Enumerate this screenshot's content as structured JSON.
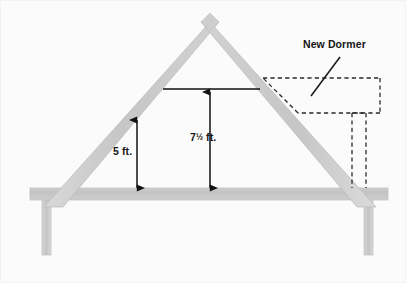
{
  "figure": {
    "width": 406,
    "height": 283,
    "background_color": "#fbfbfb",
    "frame_border_color": "#f2f2f2"
  },
  "labels": {
    "new_dormer": "New Dormer",
    "height_low": "5 ft.",
    "height_peak_whole": "7",
    "height_peak_fraction": "½",
    "height_peak_unit": " ft.",
    "height_peak_full": "7½ ft."
  },
  "colors": {
    "timber_fill": "#c9c9c9",
    "timber_fill_light": "#d6d6d6",
    "timber_stroke": "#b4b4b4",
    "joist_fill": "#c4c4c4",
    "dimension_line": "#111111",
    "dashed_line": "#2a2a2a",
    "text": "#151515"
  },
  "geometry": {
    "apex": {
      "x": 210,
      "y": 22
    },
    "left_eave": {
      "x": 42,
      "y": 196
    },
    "right_eave": {
      "x": 378,
      "y": 196
    },
    "joist_top_y": 188,
    "joist_bottom_y": 200,
    "collar_tie_y": 89,
    "collar_tie_x1": 163,
    "collar_tie_x2": 260,
    "dormer_box": {
      "x1": 263,
      "y1": 78,
      "x2": 380,
      "y2": 113
    },
    "dormer_drop_x1": 352,
    "dormer_drop_x2": 366,
    "dormer_drop_bottom_y": 188,
    "left_post_x": 42,
    "right_post_x": 364,
    "post_bottom_y": 255
  },
  "dimensions": [
    {
      "name": "low-headroom-height",
      "label": "5 ft.",
      "value": 5,
      "unit": "ft",
      "x": 137,
      "y_top": 120,
      "y_bottom": 188
    },
    {
      "name": "peak-headroom-height",
      "label": "7½ ft.",
      "value": 7.5,
      "unit": "ft",
      "x": 210,
      "y_top": 92,
      "y_bottom": 188
    }
  ],
  "annotations": [
    {
      "name": "new-dormer-callout",
      "text": "New Dormer",
      "leader_from": {
        "x": 340,
        "y": 57
      },
      "leader_to": {
        "x": 311,
        "y": 96
      }
    }
  ]
}
